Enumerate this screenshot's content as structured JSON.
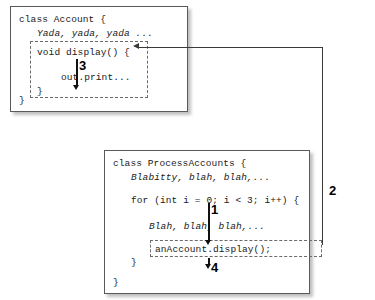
{
  "diagram": {
    "accent_color": "#3a3a3a",
    "box_border_color": "#5a5a5a",
    "text_color": "#1a1a1a"
  },
  "account_box": {
    "lines": [
      {
        "text": "class Account {",
        "style": "plain"
      },
      {
        "text": "Yada, yada, yada ...",
        "style": "italic"
      }
    ],
    "closing_brace": "}",
    "display_method": {
      "signature": "void display() {",
      "body": "out.print...",
      "closing_brace": "}"
    }
  },
  "process_box": {
    "lines": [
      {
        "text": "class ProcessAccounts {",
        "style": "plain"
      },
      {
        "text": "Blabitty, blah, blah,...",
        "style": "italic"
      }
    ],
    "for_loop": "for (int i = 0; i < 3; i++) {",
    "loop_body": "Blah, blah, blah,...",
    "call_statement": "anAccount.display();",
    "loop_closing_brace": "}",
    "closing_brace": "}"
  },
  "steps": [
    {
      "id": "1",
      "label": "1"
    },
    {
      "id": "2",
      "label": "2"
    },
    {
      "id": "3",
      "label": "3"
    },
    {
      "id": "4",
      "label": "4"
    }
  ]
}
